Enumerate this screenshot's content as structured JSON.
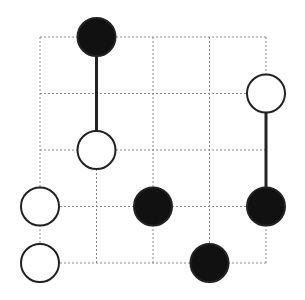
{
  "puzzle": {
    "type": "masyu",
    "grid": {
      "rows": 5,
      "cols": 5,
      "origin_x": 40,
      "origin_y": 37,
      "cell": 56.5,
      "line_color": "#888888"
    },
    "circles": [
      {
        "col": 1,
        "row": 0,
        "color": "black"
      },
      {
        "col": 4,
        "row": 1,
        "color": "white"
      },
      {
        "col": 1,
        "row": 2,
        "color": "white"
      },
      {
        "col": 0,
        "row": 3,
        "color": "white"
      },
      {
        "col": 2,
        "row": 3,
        "color": "black"
      },
      {
        "col": 4,
        "row": 3,
        "color": "black"
      },
      {
        "col": 0,
        "row": 4,
        "color": "white"
      },
      {
        "col": 3,
        "row": 4,
        "color": "black"
      }
    ],
    "segments": [
      {
        "from": [
          1,
          0
        ],
        "to": [
          1,
          2
        ]
      },
      {
        "from": [
          4,
          1
        ],
        "to": [
          4,
          3
        ]
      }
    ],
    "circle_radius": 19,
    "colors": {
      "black": "#111111",
      "white": "#ffffff",
      "stroke": "#222222",
      "segment": "#222222"
    }
  }
}
